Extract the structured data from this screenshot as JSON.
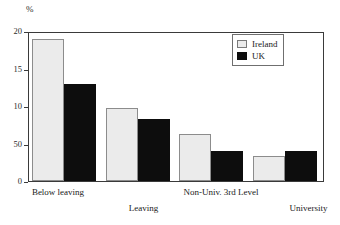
{
  "chart_data": {
    "type": "bar",
    "title": "",
    "subtitle": "",
    "xlabel": "",
    "ylabel": "%",
    "unit_label": "%",
    "categories": [
      "Below leaving",
      "Leaving",
      "Non-Univ. 3rd Level",
      "University"
    ],
    "series": [
      {
        "name": "Ireland",
        "color": "#ebebeb",
        "values": [
          19.2,
          9.8,
          6.3,
          3.4
        ]
      },
      {
        "name": "UK",
        "color": "#0d0d0d",
        "values": [
          13.1,
          8.4,
          4.1,
          4.1
        ]
      }
    ],
    "ylim": [
      0,
      20
    ],
    "ytick_values": [
      20,
      15,
      10,
      5,
      0
    ],
    "ytick_labels": [
      "20",
      "15",
      "10",
      "50",
      "0"
    ],
    "grid": false,
    "legend_position": "top-right",
    "legend_entries": [
      "Ireland",
      "UK"
    ],
    "annotations": []
  },
  "legend": {
    "ireland_label": "Ireland",
    "uk_label": "UK"
  },
  "axis": {
    "unit": "%"
  }
}
